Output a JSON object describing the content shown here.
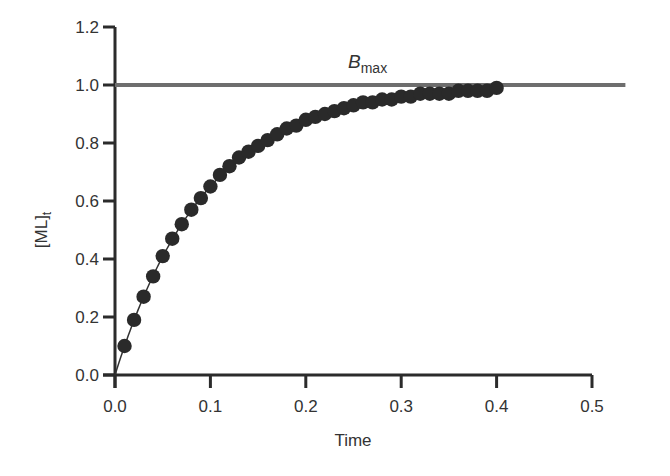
{
  "chart_data": {
    "type": "scatter",
    "title": "",
    "xlabel": "Time",
    "ylabel": "[ML]",
    "ylabel_subscript": "t",
    "xlim": [
      0,
      0.5
    ],
    "ylim": [
      0,
      1.2
    ],
    "xticks": [
      "0.0",
      "0.1",
      "0.2",
      "0.3",
      "0.4",
      "0.5"
    ],
    "yticks": [
      "0.0",
      "0.2",
      "0.4",
      "0.6",
      "0.8",
      "1.0",
      "1.2"
    ],
    "grid": false,
    "legend": null,
    "annotations": [
      {
        "text": "B",
        "subscript": "max",
        "x": 0.25,
        "y": 1.07,
        "italic_base": true
      }
    ],
    "reference_line": {
      "name": "Bmax",
      "y": 1.0,
      "x_start": 0.0,
      "x_end": 0.535,
      "color": "#6e6e6e"
    },
    "fit_curve": {
      "model": "1 - exp(-k*t)",
      "k": 10.5,
      "x_start": 0.0,
      "x_end": 0.4,
      "color": "#333333"
    },
    "series": [
      {
        "name": "[ML]t data",
        "marker": "circle",
        "color": "#2a2a2a",
        "x": [
          0.01,
          0.02,
          0.03,
          0.04,
          0.05,
          0.06,
          0.07,
          0.08,
          0.09,
          0.1,
          0.11,
          0.12,
          0.13,
          0.14,
          0.15,
          0.16,
          0.17,
          0.18,
          0.19,
          0.2,
          0.21,
          0.22,
          0.23,
          0.24,
          0.25,
          0.26,
          0.27,
          0.28,
          0.29,
          0.3,
          0.31,
          0.32,
          0.33,
          0.34,
          0.35,
          0.36,
          0.37,
          0.38,
          0.39,
          0.4
        ],
        "y": [
          0.1,
          0.19,
          0.27,
          0.34,
          0.41,
          0.47,
          0.52,
          0.57,
          0.61,
          0.65,
          0.69,
          0.72,
          0.75,
          0.77,
          0.79,
          0.81,
          0.83,
          0.85,
          0.86,
          0.88,
          0.89,
          0.9,
          0.91,
          0.92,
          0.93,
          0.94,
          0.94,
          0.95,
          0.95,
          0.96,
          0.96,
          0.97,
          0.97,
          0.97,
          0.97,
          0.98,
          0.98,
          0.98,
          0.98,
          0.99
        ]
      }
    ]
  }
}
